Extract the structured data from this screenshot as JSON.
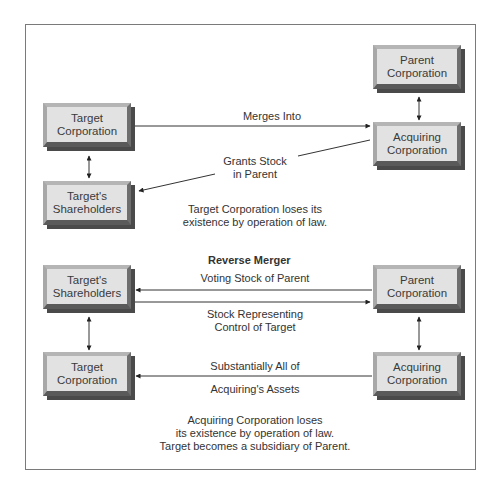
{
  "diagram": {
    "top_section": {
      "boxes": {
        "target_corporation": "Target Corporation",
        "targets_shareholders": "Target's Shareholders",
        "parent_corporation": "Parent Corporation",
        "acquiring_corporation": "Acquiring Corporation"
      },
      "edges": {
        "merges_into": "Merges Into",
        "grants_stock_line1": "Grants Stock",
        "grants_stock_line2": "in Parent"
      },
      "note_line1": "Target Corporation loses its",
      "note_line2": "existence by operation of law."
    },
    "bottom_section": {
      "title": "Reverse Merger",
      "boxes": {
        "targets_shareholders": "Target's Shareholders",
        "target_corporation": "Target Corporation",
        "parent_corporation": "Parent Corporation",
        "acquiring_corporation": "Acquiring Corporation"
      },
      "edges": {
        "voting_stock": "Voting Stock of Parent",
        "stock_representing_line1": "Stock Representing",
        "stock_representing_line2": "Control of Target",
        "assets_line1": "Substantially All of",
        "assets_line2": "Acquiring's Assets"
      },
      "note_line1": "Acquiring Corporation loses",
      "note_line2": "its existence by operation of law.",
      "note_line3": "Target becomes a subsidiary of Parent."
    }
  }
}
